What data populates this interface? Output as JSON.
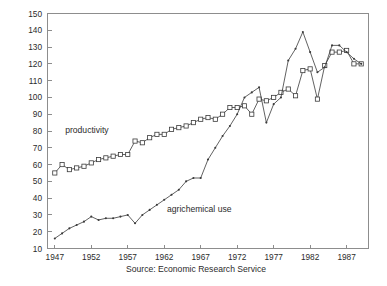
{
  "chart_data": {
    "type": "line",
    "title": "",
    "xlabel": "",
    "ylabel": "",
    "xlim": [
      1946,
      1990
    ],
    "ylim": [
      10,
      150
    ],
    "grid": false,
    "legend_position": "inline-annotations",
    "x_ticks": [
      1947,
      1952,
      1957,
      1962,
      1967,
      1972,
      1977,
      1982,
      1987
    ],
    "x_tick_labels": [
      "1947",
      "1952",
      "1957",
      "1962",
      "1967",
      "1972",
      "1977",
      "1982",
      "1987"
    ],
    "y_ticks": [
      10,
      20,
      30,
      40,
      50,
      60,
      70,
      80,
      90,
      100,
      110,
      120,
      130,
      140,
      150
    ],
    "y_tick_labels": [
      "10",
      "20",
      "30",
      "40",
      "50",
      "60",
      "70",
      "80",
      "90",
      "100",
      "110",
      "120",
      "130",
      "140",
      "150"
    ],
    "x": [
      1947,
      1948,
      1949,
      1950,
      1951,
      1952,
      1953,
      1954,
      1955,
      1956,
      1957,
      1958,
      1959,
      1960,
      1961,
      1962,
      1963,
      1964,
      1965,
      1966,
      1967,
      1968,
      1969,
      1970,
      1971,
      1972,
      1973,
      1974,
      1975,
      1976,
      1977,
      1978,
      1979,
      1980,
      1981,
      1982,
      1983,
      1984,
      1985,
      1986,
      1987,
      1988,
      1989
    ],
    "series": [
      {
        "name": "productivity",
        "marker": "open-square",
        "values": [
          55,
          60,
          57,
          58,
          59,
          61,
          63,
          64,
          65,
          66,
          66,
          74,
          73,
          76,
          78,
          78,
          81,
          82,
          83,
          85,
          87,
          88,
          87,
          90,
          94,
          94,
          95,
          90,
          99,
          98,
          100,
          103,
          105,
          101,
          116,
          117,
          99,
          119,
          127,
          127,
          128,
          120,
          120
        ]
      },
      {
        "name": "agrichemical use",
        "marker": "dot",
        "values": [
          16,
          19,
          22,
          24,
          26,
          29,
          27,
          28,
          28,
          29,
          30,
          25,
          30,
          33,
          36,
          39,
          42,
          45,
          50,
          52,
          52,
          63,
          70,
          77,
          83,
          90,
          100,
          103,
          106,
          85,
          96,
          100,
          122,
          129,
          139,
          127,
          115,
          118,
          131,
          131,
          127,
          123,
          120
        ]
      }
    ],
    "annotations": [
      {
        "text": "productivity",
        "x": 1951.4,
        "y": 79
      },
      {
        "text": "agrichemical use",
        "x": 1966.8,
        "y": 32
      }
    ],
    "caption": "Source:  Economic Research Service"
  }
}
